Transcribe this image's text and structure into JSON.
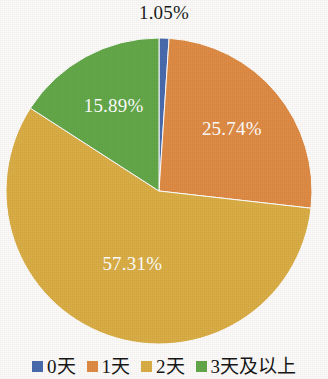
{
  "chart_data": {
    "type": "pie",
    "title": "",
    "categories": [
      "0天",
      "1天",
      "2天",
      "3天及以上"
    ],
    "values": [
      1.05,
      25.74,
      57.31,
      15.89
    ],
    "value_unit": "%",
    "data_labels": [
      "1.05%",
      "25.74%",
      "57.31%",
      "15.89%"
    ],
    "colors": [
      "#4A6BAD",
      "#E08C45",
      "#DBAE46",
      "#64A84A"
    ],
    "label_colors": [
      "#1c1c1c",
      "#ffffff",
      "#ffffff",
      "#ffffff"
    ],
    "start_angle_deg": 0,
    "direction": "clockwise",
    "legend_position": "bottom",
    "grid": false,
    "xlabel": "",
    "ylabel": ""
  },
  "callout": {
    "text": "1.05%"
  },
  "slices": [
    {
      "label": "0天",
      "percent_text": "1.05%",
      "color": "#4A6BAD"
    },
    {
      "label": "1天",
      "percent_text": "25.74%",
      "color": "#E08C45"
    },
    {
      "label": "2天",
      "percent_text": "57.31%",
      "color": "#DBAE46"
    },
    {
      "label": "3天及以上",
      "percent_text": "15.89%",
      "color": "#64A84A"
    }
  ],
  "legend": {
    "items": [
      {
        "label": "0天",
        "color": "#4A6BAD"
      },
      {
        "label": "1天",
        "color": "#E08C45"
      },
      {
        "label": "2天",
        "color": "#DBAE46"
      },
      {
        "label": "3天及以上",
        "color": "#64A84A"
      }
    ]
  }
}
